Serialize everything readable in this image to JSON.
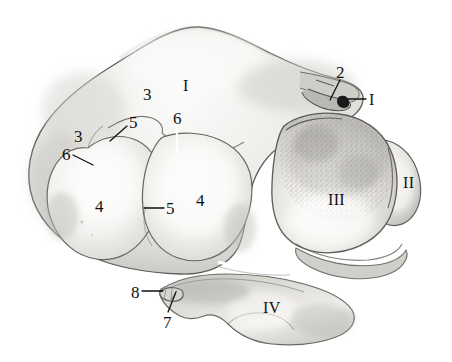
{
  "figure": {
    "kind": "anatomical-illustration",
    "background_color": "#ffffff",
    "ink_color": "#111111",
    "width": 452,
    "height": 362,
    "palette": {
      "outline": "#5a5a5a",
      "outline_dark": "#3b3b3b",
      "fill_light": "#f7f7f6",
      "fill_mid": "#e2e1de",
      "fill_shadow": "#c8c7c3",
      "fill_deep_shadow": "#a9a8a4",
      "stipple": "#9b9a96",
      "notch_black": "#1a1a1a",
      "leader_line": "#111111",
      "leader_line_light": "#ffffff"
    }
  },
  "labels": [
    {
      "id": "roman-I",
      "text": "I",
      "style": "roman",
      "x": 183,
      "y": 78,
      "leader": null
    },
    {
      "id": "roman-II",
      "text": "II",
      "style": "roman",
      "x": 403,
      "y": 175,
      "leader": null
    },
    {
      "id": "roman-III",
      "text": "III",
      "style": "roman",
      "x": 328,
      "y": 192,
      "leader": null
    },
    {
      "id": "roman-IV",
      "text": "IV",
      "style": "roman",
      "x": 263,
      "y": 300,
      "leader": null
    },
    {
      "id": "num-2",
      "text": "2",
      "style": "arabic",
      "x": 336,
      "y": 64,
      "leader": {
        "x1": 340,
        "y1": 80,
        "x2": 330,
        "y2": 100,
        "color": "#111111"
      }
    },
    {
      "id": "num-I-ptr",
      "text": "I",
      "style": "roman",
      "x": 369,
      "y": 92,
      "leader": {
        "x1": 366,
        "y1": 99,
        "x2": 348,
        "y2": 99,
        "color": "#111111"
      }
    },
    {
      "id": "num-3-upper",
      "text": "3",
      "style": "arabic",
      "x": 143,
      "y": 86,
      "leader": null
    },
    {
      "id": "num-3-lower",
      "text": "3",
      "style": "arabic",
      "x": 74,
      "y": 128,
      "leader": null
    },
    {
      "id": "num-5-upper",
      "text": "5",
      "style": "arabic",
      "x": 129,
      "y": 114,
      "leader": {
        "x1": 127,
        "y1": 126,
        "x2": 110,
        "y2": 141,
        "color": "#111111"
      }
    },
    {
      "id": "num-5-lower",
      "text": "5",
      "style": "arabic",
      "x": 166,
      "y": 200,
      "leader": {
        "x1": 164,
        "y1": 208,
        "x2": 144,
        "y2": 208,
        "color": "#111111"
      }
    },
    {
      "id": "num-6-upper",
      "text": "6",
      "style": "arabic",
      "x": 173,
      "y": 110,
      "leader": {
        "x1": 177,
        "y1": 122,
        "x2": 177,
        "y2": 152,
        "color": "#ffffff"
      }
    },
    {
      "id": "num-6-lower",
      "text": "6",
      "style": "arabic",
      "x": 62,
      "y": 146,
      "leader": {
        "x1": 73,
        "y1": 155,
        "x2": 93,
        "y2": 165,
        "color": "#111111"
      }
    },
    {
      "id": "num-4-left",
      "text": "4",
      "style": "arabic",
      "x": 95,
      "y": 198,
      "leader": null
    },
    {
      "id": "num-4-right",
      "text": "4",
      "style": "arabic",
      "x": 196,
      "y": 192,
      "leader": null
    },
    {
      "id": "num-8",
      "text": "8",
      "style": "arabic",
      "x": 131,
      "y": 284,
      "leader": {
        "x1": 142,
        "y1": 291,
        "x2": 163,
        "y2": 291,
        "color": "#111111"
      }
    },
    {
      "id": "num-7",
      "text": "7",
      "style": "arabic",
      "x": 163,
      "y": 314,
      "leader": {
        "x1": 168,
        "y1": 312,
        "x2": 176,
        "y2": 292,
        "color": "#111111"
      }
    }
  ],
  "regions": [
    {
      "id": "lobe-I",
      "name": "superior-body-region"
    },
    {
      "id": "lobe-II",
      "name": "right-lateral-process"
    },
    {
      "id": "lobe-III",
      "name": "right-articular-facet"
    },
    {
      "id": "lobe-IV",
      "name": "inferior-process"
    },
    {
      "id": "lobe-4-left",
      "name": "left-condyle"
    },
    {
      "id": "lobe-4-right",
      "name": "central-condyle"
    }
  ]
}
